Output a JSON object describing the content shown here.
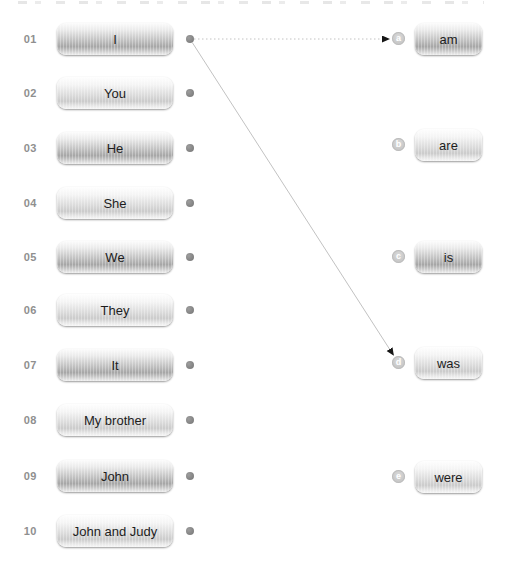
{
  "exercise": {
    "type": "matching",
    "left_column_role": "subjects",
    "right_column_role": "verb-forms"
  },
  "left_items": [
    {
      "num": "01",
      "label": "I",
      "shade": "dark"
    },
    {
      "num": "02",
      "label": "You",
      "shade": "light"
    },
    {
      "num": "03",
      "label": "He",
      "shade": "dark"
    },
    {
      "num": "04",
      "label": "She",
      "shade": "light"
    },
    {
      "num": "05",
      "label": "We",
      "shade": "dark"
    },
    {
      "num": "06",
      "label": "They",
      "shade": "light"
    },
    {
      "num": "07",
      "label": "It",
      "shade": "dark"
    },
    {
      "num": "08",
      "label": "My brother",
      "shade": "light"
    },
    {
      "num": "09",
      "label": "John",
      "shade": "dark"
    },
    {
      "num": "10",
      "label": "John and Judy",
      "shade": "light"
    }
  ],
  "right_items": [
    {
      "letter": "a",
      "label": "am",
      "shade": "dark"
    },
    {
      "letter": "b",
      "label": "are",
      "shade": "light"
    },
    {
      "letter": "c",
      "label": "is",
      "shade": "dark"
    },
    {
      "letter": "d",
      "label": "was",
      "shade": "light"
    },
    {
      "letter": "e",
      "label": "were",
      "shade": "light"
    }
  ],
  "connections": [
    {
      "from_num": "01",
      "to_letter": "a",
      "line_style": "dotted"
    },
    {
      "from_num": "01",
      "to_letter": "d",
      "line_style": "solid"
    }
  ],
  "colors": {
    "line": "#c2c2c2",
    "arrowhead": "#161616",
    "dot": "#7a7a7a",
    "badge_bg": "#c6c6c6",
    "badge_text": "#ffffff",
    "number_text": "#8f8f8f",
    "button_text": "#1d1d1d",
    "background": "#ffffff"
  }
}
